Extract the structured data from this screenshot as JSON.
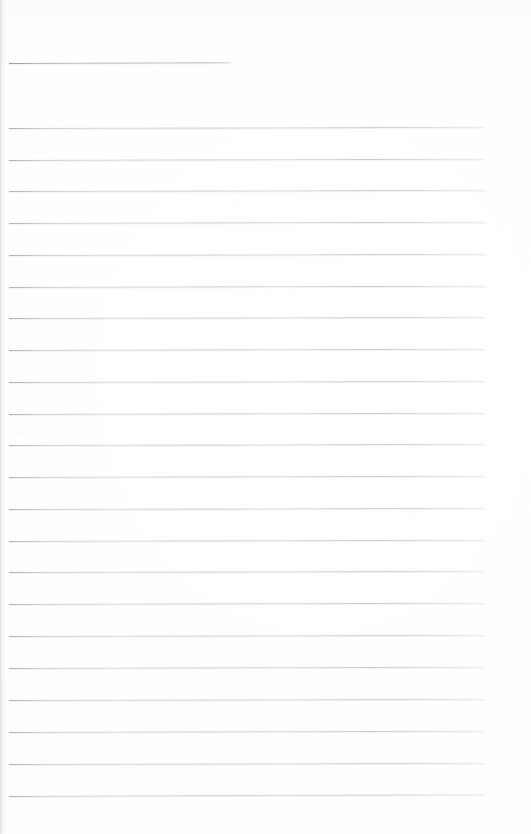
{
  "document": {
    "kind": "scanned-lined-notepad-page",
    "title": "",
    "page_label": "",
    "background_color": "#ffffff",
    "rule_color": "#c3c6cd",
    "header_rule_color": "#a9acb5",
    "width": 531,
    "height": 834,
    "body_text": "",
    "handwriting_present": false,
    "notes_count": 0
  },
  "header_rule": {
    "name": "title-rule",
    "x": 9,
    "y": 63,
    "width": 222,
    "tilt_deg": -0.18
  },
  "rules": [
    {
      "index": 1,
      "x": 9,
      "y": 128,
      "width": 476,
      "tilt_deg": -0.14
    },
    {
      "index": 2,
      "x": 9,
      "y": 160,
      "width": 476,
      "tilt_deg": -0.16
    },
    {
      "index": 3,
      "x": 9,
      "y": 191,
      "width": 476,
      "tilt_deg": -0.14
    },
    {
      "index": 4,
      "x": 9,
      "y": 223,
      "width": 476,
      "tilt_deg": -0.15
    },
    {
      "index": 5,
      "x": 9,
      "y": 255,
      "width": 476,
      "tilt_deg": -0.14
    },
    {
      "index": 6,
      "x": 9,
      "y": 287,
      "width": 476,
      "tilt_deg": -0.16
    },
    {
      "index": 7,
      "x": 9,
      "y": 318,
      "width": 476,
      "tilt_deg": -0.14
    },
    {
      "index": 8,
      "x": 9,
      "y": 350,
      "width": 476,
      "tilt_deg": -0.15
    },
    {
      "index": 9,
      "x": 9,
      "y": 382,
      "width": 476,
      "tilt_deg": -0.14
    },
    {
      "index": 10,
      "x": 9,
      "y": 414,
      "width": 476,
      "tilt_deg": -0.16
    },
    {
      "index": 11,
      "x": 9,
      "y": 445,
      "width": 476,
      "tilt_deg": -0.14
    },
    {
      "index": 12,
      "x": 9,
      "y": 477,
      "width": 476,
      "tilt_deg": -0.15
    },
    {
      "index": 13,
      "x": 9,
      "y": 509,
      "width": 476,
      "tilt_deg": -0.14
    },
    {
      "index": 14,
      "x": 9,
      "y": 541,
      "width": 476,
      "tilt_deg": -0.16
    },
    {
      "index": 15,
      "x": 9,
      "y": 572,
      "width": 476,
      "tilt_deg": -0.14
    },
    {
      "index": 16,
      "x": 9,
      "y": 604,
      "width": 476,
      "tilt_deg": -0.15
    },
    {
      "index": 17,
      "x": 9,
      "y": 636,
      "width": 476,
      "tilt_deg": -0.14
    },
    {
      "index": 18,
      "x": 9,
      "y": 668,
      "width": 476,
      "tilt_deg": -0.16
    },
    {
      "index": 19,
      "x": 9,
      "y": 700,
      "width": 476,
      "tilt_deg": -0.14
    },
    {
      "index": 20,
      "x": 9,
      "y": 732,
      "width": 476,
      "tilt_deg": -0.15
    },
    {
      "index": 21,
      "x": 9,
      "y": 764,
      "width": 476,
      "tilt_deg": -0.14
    },
    {
      "index": 22,
      "x": 9,
      "y": 796,
      "width": 476,
      "tilt_deg": -0.22
    }
  ]
}
